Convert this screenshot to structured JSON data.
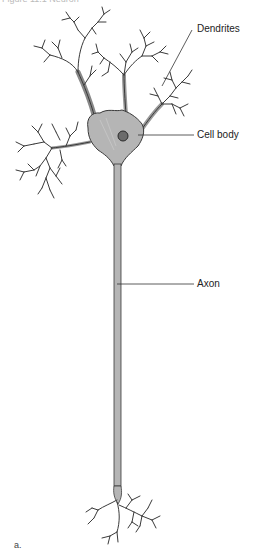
{
  "figure": {
    "title_cut": "Figure 11.1  Neuron",
    "labels": {
      "dendrites": "Dendrites",
      "cell_body": "Cell body",
      "axon": "Axon"
    },
    "panel_caption": "a.",
    "colors": {
      "fill": "#b5b5b5",
      "stroke": "#3a3a3a",
      "nucleus": "#6b6b6b",
      "leader": "#333333"
    }
  }
}
